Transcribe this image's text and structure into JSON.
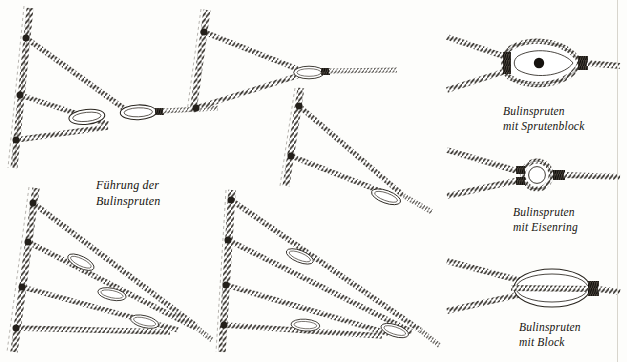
{
  "plate": {
    "title": "Führung der\nBulinspruten",
    "language": "de",
    "background_color": "#fdfdfb",
    "ink_color": "#1a1814",
    "width": 627,
    "height": 362
  },
  "captions": {
    "sprutenblock": "Bulinspruten\nmit Sprutenblock",
    "eisenring": "Bulinspruten\nmit Eisenring",
    "block": "Bulinspruten\nmit Block"
  },
  "figures": [
    {
      "id": "fig-top-left",
      "name": "bridle-three-leg-upper-left",
      "legs": 3,
      "thimbles": 2,
      "description": "Dreifache Bulinsprut am Stag"
    },
    {
      "id": "fig-top-center",
      "name": "bridle-two-leg-upper-center",
      "legs": 2,
      "thimbles": 1,
      "description": "Zweifache Bulinsprut am Stag"
    },
    {
      "id": "fig-mid-center",
      "name": "bridle-two-leg-mid-center",
      "legs": 2,
      "thimbles": 1,
      "description": "Zweifache Bulinsprut, tiefer angesetzt"
    },
    {
      "id": "fig-bottom-left",
      "name": "bridle-four-leg-lower-left",
      "legs": 4,
      "thimbles": 3,
      "description": "Vierfache Bulinsprut am Stag"
    },
    {
      "id": "fig-bottom-center",
      "name": "bridle-four-leg-lower-center",
      "legs": 4,
      "thimbles": 3,
      "description": "Vierfache Bulinsprut am Stag"
    }
  ],
  "details": [
    {
      "id": "detail-sprutenblock",
      "name": "detail-sprutenblock",
      "fitting": "Sprutenblock",
      "has_center_pin": true,
      "has_seizing": true
    },
    {
      "id": "detail-eisenring",
      "name": "detail-eisenring",
      "fitting": "Eisenring",
      "has_center_pin": false,
      "has_seizing": true
    },
    {
      "id": "detail-block",
      "name": "detail-block",
      "fitting": "Block",
      "has_center_pin": false,
      "has_seizing": true
    }
  ]
}
